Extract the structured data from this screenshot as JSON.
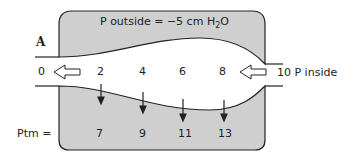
{
  "panel_label": "A",
  "outside_pressure": {
    "prefix": "P outside = ",
    "value": "−5 cm H",
    "sub": "2",
    "suffix": "O"
  },
  "inside_label": "10 P inside",
  "flow_values": [
    "0",
    "2",
    "4",
    "6",
    "8"
  ],
  "ptm_label": "Ptm =",
  "ptm_values": [
    "7",
    "9",
    "11",
    "13"
  ],
  "colors": {
    "chamber": "#cfcfcf",
    "line": "#222222"
  }
}
